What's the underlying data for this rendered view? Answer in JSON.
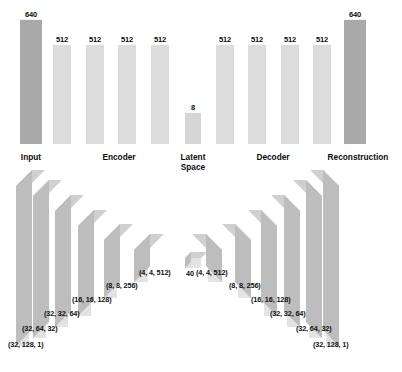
{
  "colors": {
    "input_bar": "#a9a9a9",
    "hidden_bar": "#dcdcdc",
    "latent_bar": "#d6d6d6",
    "text": "#0d0d0d",
    "block_front": "#e3e3e3",
    "block_top": "#d0d0d0",
    "block_side": "#bdbdbd",
    "background": "#ffffff"
  },
  "chart_data": {
    "type": "bar",
    "title": "",
    "xlabel": "",
    "ylabel": "",
    "categories": [
      "Input",
      "Encoder 1",
      "Encoder 2",
      "Encoder 3",
      "Encoder 4",
      "Latent Space",
      "Decoder 1",
      "Decoder 2",
      "Decoder 3",
      "Decoder 4",
      "Reconstruction"
    ],
    "values": [
      640,
      512,
      512,
      512,
      512,
      8,
      512,
      512,
      512,
      512,
      640
    ],
    "value_labels": [
      "640",
      "512",
      "512",
      "512",
      "512",
      "8",
      "512",
      "512",
      "512",
      "512",
      "640"
    ],
    "ylim": [
      0,
      700
    ],
    "grid": false,
    "legend": null
  },
  "bars": [
    {
      "label": "640",
      "value": 640,
      "x": 20.0,
      "w": 22.0,
      "h": 124.0,
      "color": "#a9a9a9",
      "name": "bar-input-640"
    },
    {
      "label": "512",
      "value": 512,
      "x": 53.0,
      "w": 18.0,
      "h": 99.0,
      "color": "#dcdcdc",
      "name": "bar-encoder-512-1"
    },
    {
      "label": "512",
      "value": 512,
      "x": 86.0,
      "w": 18.0,
      "h": 99.0,
      "color": "#dcdcdc",
      "name": "bar-encoder-512-2"
    },
    {
      "label": "512",
      "value": 512,
      "x": 118.0,
      "w": 18.0,
      "h": 99.0,
      "color": "#dcdcdc",
      "name": "bar-encoder-512-3"
    },
    {
      "label": "512",
      "value": 512,
      "x": 151.0,
      "w": 18.0,
      "h": 99.0,
      "color": "#dcdcdc",
      "name": "bar-encoder-512-4"
    },
    {
      "label": "8",
      "value": 8,
      "x": 185.0,
      "w": 16.0,
      "h": 31.0,
      "color": "#d6d6d6",
      "name": "bar-latent-8"
    },
    {
      "label": "512",
      "value": 512,
      "x": 216.0,
      "w": 18.0,
      "h": 99.0,
      "color": "#dcdcdc",
      "name": "bar-decoder-512-1"
    },
    {
      "label": "512",
      "value": 512,
      "x": 248.0,
      "w": 18.0,
      "h": 99.0,
      "color": "#dcdcdc",
      "name": "bar-decoder-512-2"
    },
    {
      "label": "512",
      "value": 512,
      "x": 281.0,
      "w": 18.0,
      "h": 99.0,
      "color": "#dcdcdc",
      "name": "bar-decoder-512-3"
    },
    {
      "label": "512",
      "value": 512,
      "x": 313.0,
      "w": 18.0,
      "h": 99.0,
      "color": "#dcdcdc",
      "name": "bar-decoder-512-4"
    },
    {
      "label": "640",
      "value": 640,
      "x": 344.0,
      "w": 22.0,
      "h": 124.0,
      "color": "#a9a9a9",
      "name": "bar-reconstruction-640"
    }
  ],
  "sections": [
    {
      "label": "Input",
      "cx": 31,
      "two_line": false,
      "name": "section-label-input"
    },
    {
      "label": "Encoder",
      "cx": 119,
      "two_line": false,
      "name": "section-label-encoder"
    },
    {
      "label": "Latent Space",
      "cx": 193,
      "two_line": true,
      "name": "section-label-latent-space"
    },
    {
      "label": "Decoder",
      "cx": 273,
      "two_line": false,
      "name": "section-label-decoder"
    },
    {
      "label": "Reconstruction",
      "cx": 358,
      "two_line": false,
      "name": "section-label-reconstruction"
    }
  ],
  "tensor_shapes": {
    "encoder": [
      {
        "label": "(32, 128, 1)",
        "x": 8,
        "y": 340,
        "name": "shape-label-encoder-32-128-1"
      },
      {
        "label": "(32, 64, 32)",
        "x": 22,
        "y": 324,
        "name": "shape-label-encoder-32-64-32"
      },
      {
        "label": "(32, 32, 64)",
        "x": 44,
        "y": 309,
        "name": "shape-label-encoder-32-32-64"
      },
      {
        "label": "(16, 16, 128)",
        "x": 72,
        "y": 295,
        "name": "shape-label-encoder-16-16-128"
      },
      {
        "label": "(8, 8, 256)",
        "x": 106,
        "y": 281,
        "name": "shape-label-encoder-8-8-256"
      },
      {
        "label": "(4, 4, 512)",
        "x": 139,
        "y": 268,
        "name": "shape-label-encoder-4-4-512"
      }
    ],
    "bottleneck": {
      "label": "40",
      "x": 186,
      "y": 269,
      "name": "shape-label-latent-40"
    },
    "decoder": [
      {
        "label": "(4, 4, 512)",
        "x": 196,
        "y": 268,
        "name": "shape-label-decoder-4-4-512"
      },
      {
        "label": "(8, 8, 256)",
        "x": 229,
        "y": 281,
        "name": "shape-label-decoder-8-8-256"
      },
      {
        "label": "(16, 16, 128)",
        "x": 251,
        "y": 295,
        "name": "shape-label-decoder-16-16-128"
      },
      {
        "label": "(32, 32, 64)",
        "x": 270,
        "y": 309,
        "name": "shape-label-decoder-32-32-64"
      },
      {
        "label": "(32, 64, 32)",
        "x": 296,
        "y": 324,
        "name": "shape-label-decoder-32-64-32"
      },
      {
        "label": "(32, 128, 1)",
        "x": 313,
        "y": 340,
        "name": "shape-label-decoder-32-128-1"
      }
    ]
  },
  "blocks_3d": {
    "encoder": [
      {
        "name": "block-encoder-32-128-1",
        "fx": 16,
        "fy": 186,
        "fw": 13,
        "fh": 160,
        "depth": 16
      },
      {
        "name": "block-encoder-32-64-32",
        "fx": 33,
        "fy": 196,
        "fw": 13,
        "fh": 142,
        "depth": 16
      },
      {
        "name": "block-encoder-32-32-64",
        "fx": 55,
        "fy": 211,
        "fw": 13,
        "fh": 116,
        "depth": 16
      },
      {
        "name": "block-encoder-16-16-128",
        "fx": 78,
        "fy": 226,
        "fw": 13,
        "fh": 90,
        "depth": 16
      },
      {
        "name": "block-encoder-8-8-256",
        "fx": 104,
        "fy": 240,
        "fw": 13,
        "fh": 58,
        "depth": 16
      },
      {
        "name": "block-encoder-4-4-512",
        "fx": 134,
        "fy": 250,
        "fw": 14,
        "fh": 32,
        "depth": 16
      }
    ],
    "bottleneck": {
      "name": "block-latent-40",
      "fx": 185,
      "fy": 258,
      "fw": 16,
      "fh": 10,
      "depth": 6
    },
    "decoder": [
      {
        "name": "block-decoder-4-4-512",
        "fx": 208,
        "fy": 250,
        "fw": 14,
        "fh": 32,
        "depth": 16
      },
      {
        "name": "block-decoder-8-8-256",
        "fx": 238,
        "fy": 240,
        "fw": 13,
        "fh": 58,
        "depth": 16
      },
      {
        "name": "block-decoder-16-16-128",
        "fx": 264,
        "fy": 226,
        "fw": 13,
        "fh": 90,
        "depth": 16
      },
      {
        "name": "block-decoder-32-32-64",
        "fx": 287,
        "fy": 211,
        "fw": 13,
        "fh": 116,
        "depth": 16
      },
      {
        "name": "block-decoder-32-64-32",
        "fx": 309,
        "fy": 196,
        "fw": 13,
        "fh": 142,
        "depth": 16
      },
      {
        "name": "block-decoder-32-128-1",
        "fx": 326,
        "fy": 186,
        "fw": 13,
        "fh": 160,
        "depth": 16
      }
    ]
  }
}
